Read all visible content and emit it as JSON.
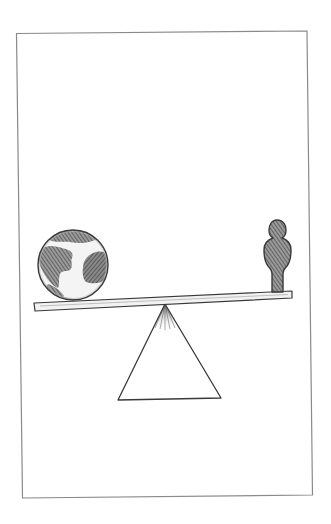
{
  "illustration": {
    "subject": "seesaw balancing a globe against a single person",
    "frame": {
      "stroke": "#8a8a8a"
    },
    "colors": {
      "ink": "#3a3a3a",
      "shade": "#6e6e6e",
      "light_shade": "#a8a8a8",
      "paper": "#ffffff"
    },
    "elements": {
      "globe": {
        "label": "globe",
        "side": "left"
      },
      "person": {
        "label": "person",
        "side": "right"
      },
      "plank": {
        "label": "seesaw plank"
      },
      "fulcrum": {
        "label": "triangular fulcrum"
      }
    }
  }
}
